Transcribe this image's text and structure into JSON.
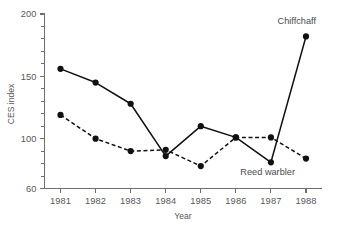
{
  "chart_data": {
    "type": "line",
    "title": "",
    "xlabel": "Year",
    "ylabel": "CES index",
    "x": [
      1981,
      1982,
      1983,
      1984,
      1985,
      1986,
      1987,
      1988
    ],
    "xtick_labels": [
      "1981",
      "1982",
      "1983",
      "1984",
      "1985",
      "1986",
      "1987",
      "1988"
    ],
    "ytick_labels": [
      "60",
      "100",
      "150",
      "200"
    ],
    "ytick_values": [
      60,
      100,
      150,
      200
    ],
    "yminor_step": 10,
    "ylim": [
      60,
      200
    ],
    "grid": false,
    "legend_position": "inline-annotations",
    "series": [
      {
        "name": "Chiffchaff",
        "style": "solid",
        "marker": "filled-circle",
        "color": "#111111",
        "values": [
          156,
          145,
          128,
          86,
          110,
          101,
          81,
          182
        ],
        "label_anchor_x": 1988,
        "label_anchor_y": 182
      },
      {
        "name": "Reed warbler",
        "style": "dashed",
        "marker": "filled-circle",
        "color": "#111111",
        "values": [
          119,
          100,
          90,
          91,
          78,
          101,
          101,
          84
        ],
        "label_anchor_x": 1987.5,
        "label_anchor_y": 73
      }
    ],
    "annotations": [
      {
        "text": "Chiffchaff",
        "x": 1988,
        "y": 192
      },
      {
        "text": "Reed warbler",
        "x": 1987.4,
        "y": 71
      }
    ]
  },
  "axes": {
    "y_axis_title": "CES index",
    "x_axis_title": "Year"
  }
}
